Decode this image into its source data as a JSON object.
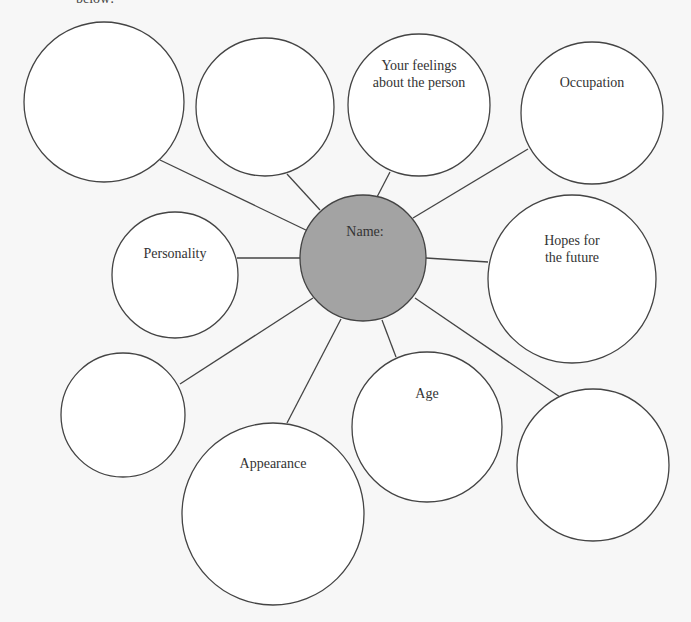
{
  "header": {
    "cut_text": "below:"
  },
  "colors": {
    "center_fill": "#a3a3a3",
    "stroke": "#444444",
    "bubble_fill": "#ffffff",
    "text": "#333333"
  },
  "center": {
    "label": "Name:"
  },
  "bubbles": [
    {
      "id": "empty-top-left",
      "label": ""
    },
    {
      "id": "empty-top",
      "label": ""
    },
    {
      "id": "feelings",
      "line1": "Your feelings",
      "line2": "about the person"
    },
    {
      "id": "occupation",
      "label": "Occupation"
    },
    {
      "id": "personality",
      "label": "Personality"
    },
    {
      "id": "hopes",
      "line1": "Hopes for",
      "line2": "the future"
    },
    {
      "id": "empty-left",
      "label": ""
    },
    {
      "id": "age",
      "label": "Age"
    },
    {
      "id": "appearance",
      "label": "Appearance"
    },
    {
      "id": "empty-bottom-right",
      "label": ""
    }
  ]
}
